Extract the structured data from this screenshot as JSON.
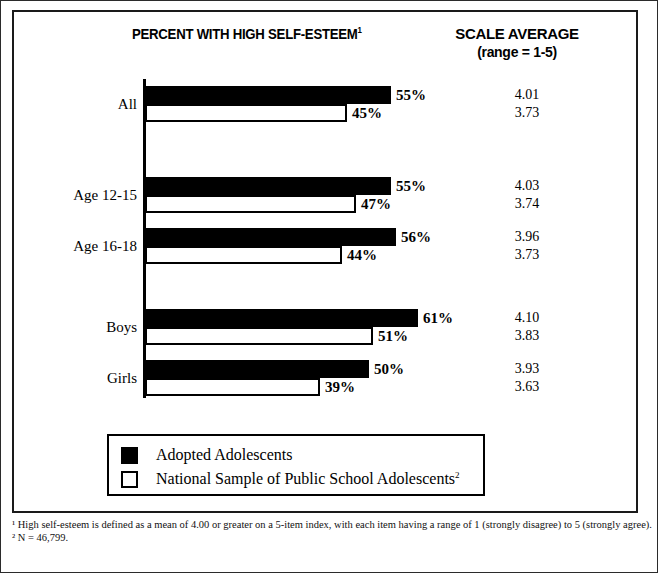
{
  "header": {
    "title_percent": "PERCENT WITH HIGH SELF-ESTEEM",
    "title_percent_footnote": "1",
    "title_scale_line1": "SCALE AVERAGE",
    "title_scale_line2": "(range = 1-5)"
  },
  "legend": {
    "items": [
      {
        "label": "Adopted Adolescents",
        "swatch": "filled",
        "footnote": ""
      },
      {
        "label": "National Sample of Public School Adolescents",
        "swatch": "hollow",
        "footnote": "2"
      }
    ]
  },
  "footnotes": {
    "note1": "¹ High self-esteem is defined as a mean of 4.00 or greater on a 5-item index, with each item having a range of 1 (strongly disagree) to 5 (strongly agree).",
    "note2": "² N = 46,799."
  },
  "chart_data": {
    "type": "bar",
    "orientation": "horizontal",
    "title": "PERCENT WITH HIGH SELF-ESTEEM",
    "xlabel": "",
    "ylabel": "",
    "xlim": [
      0,
      65
    ],
    "grid": false,
    "legend_position": "bottom",
    "categories": [
      "All",
      "Age 12-15",
      "Age 16-18",
      "Boys",
      "Girls"
    ],
    "series": [
      {
        "name": "Adopted Adolescents",
        "values": [
          55,
          55,
          56,
          61,
          50
        ],
        "value_labels": [
          "55%",
          "55%",
          "56%",
          "61%",
          "50%"
        ],
        "scale_average": [
          4.01,
          4.03,
          3.96,
          4.1,
          3.93
        ],
        "scale_average_labels": [
          "4.01",
          "4.03",
          "3.96",
          "4.10",
          "3.93"
        ]
      },
      {
        "name": "National Sample of Public School Adolescents",
        "values": [
          45,
          47,
          44,
          51,
          39
        ],
        "value_labels": [
          "45%",
          "47%",
          "44%",
          "51%",
          "39%"
        ],
        "scale_average": [
          3.73,
          3.74,
          3.73,
          3.83,
          3.63
        ],
        "scale_average_labels": [
          "3.73",
          "3.74",
          "3.73",
          "3.83",
          "3.63"
        ]
      }
    ],
    "colors": {
      "adopted": "#000000",
      "national": "#ffffff",
      "outline": "#000000"
    }
  },
  "layout": {
    "groups": [
      {
        "key": "All",
        "top": 74,
        "label_top": 83
      },
      {
        "key": "Age 12-15",
        "top": 165,
        "label_top": 174
      },
      {
        "key": "Age 16-18",
        "top": 216,
        "label_top": 225
      },
      {
        "key": "Boys",
        "top": 297,
        "label_top": 306
      },
      {
        "key": "Girls",
        "top": 348,
        "label_top": 357
      }
    ],
    "px_per_percent": 4.48,
    "axis_x": 131
  }
}
